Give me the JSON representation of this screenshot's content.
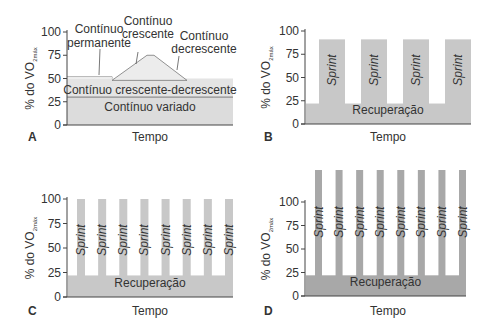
{
  "chart_data": [
    {
      "panel": "A",
      "type": "area",
      "title": "",
      "xlabel": "Tempo",
      "ylabel": "% do VO2máx",
      "ylabel_main": "% do VO",
      "ylabel_sub": "2máx",
      "yticks": [
        0,
        25,
        50,
        75,
        100
      ],
      "ylim": [
        0,
        100
      ],
      "regions": [
        {
          "name": "Contínuo permanente",
          "level": 52
        },
        {
          "name": "Contínuo crescente",
          "from": 48,
          "to": 75
        },
        {
          "name": "Contínuo decrescente",
          "from": 75,
          "to": 48
        },
        {
          "name": "Contínuo crescente-decrescente",
          "level": 50
        },
        {
          "name": "Contínuo variado",
          "level": 30
        }
      ],
      "labels": {
        "permanente_1": "Contínuo",
        "permanente_2": "permanente",
        "crescente_1": "Contínuo",
        "crescente_2": "crescente",
        "decrescente_1": "Contínuo",
        "decrescente_2": "decrescente",
        "cresc_decresc": "Contínuo crescente-decrescente",
        "variado": "Contínuo variado"
      }
    },
    {
      "panel": "B",
      "type": "bar",
      "xlabel": "Tempo",
      "ylabel": "% do VO2máx",
      "ylabel_main": "% do VO",
      "ylabel_sub": "2máx",
      "yticks": [
        0,
        25,
        50,
        75,
        100
      ],
      "ylim": [
        0,
        100
      ],
      "sprint_count": 4,
      "sprint_level": 91,
      "recovery_level": 22,
      "sprint_label": "Sprint",
      "recovery_label": "Recuperação"
    },
    {
      "panel": "C",
      "type": "bar",
      "xlabel": "Tempo",
      "ylabel": "% do VO2máx",
      "ylabel_main": "% do VO",
      "ylabel_sub": "2máx",
      "yticks": [
        0,
        25,
        50,
        75,
        100
      ],
      "ylim": [
        0,
        100
      ],
      "sprint_count": 8,
      "sprint_level": 100,
      "recovery_level": 22,
      "sprint_label": "Sprint",
      "recovery_label": "Recuperação"
    },
    {
      "panel": "D",
      "type": "bar",
      "xlabel": "Tempo",
      "ylabel": "% do VO2máx",
      "ylabel_main": "% do VO",
      "ylabel_sub": "2máx",
      "yticks": [
        0,
        25,
        50,
        75,
        100
      ],
      "ylim": [
        0,
        100
      ],
      "sprint_count": 8,
      "sprint_level": 140,
      "recovery_level": 22,
      "sprint_label": "Sprint",
      "recovery_label": "Recuperação"
    }
  ],
  "panel_letters": [
    "A",
    "B",
    "C",
    "D"
  ],
  "colors": {
    "light_fill": "#dcdcdc",
    "mid_fill": "#c8c8c8",
    "dark_fill": "#a8a8a8",
    "axis": "#444444",
    "text": "#333333"
  }
}
